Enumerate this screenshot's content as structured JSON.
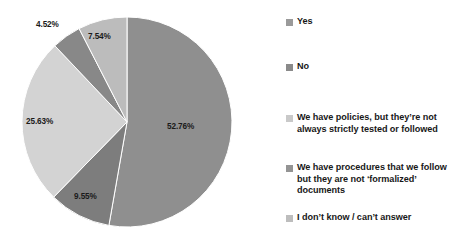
{
  "chart_data": {
    "type": "pie",
    "title": "",
    "subtitle": "",
    "xlabel": "",
    "ylabel": "",
    "grid": false,
    "legend_position": "right",
    "start_angle_deg": 0,
    "direction": "clockwise",
    "categories": [
      "Yes",
      "No",
      "We have policies, but they're not always strictly tested or followed",
      "We have procedures that we follow but they are not 'formalized' documents",
      "I don't know / can't answer"
    ],
    "values": [
      52.76,
      9.55,
      25.63,
      4.52,
      7.54
    ],
    "value_labels": [
      "52.76%",
      "9.55%",
      "25.63%",
      "4.52%",
      "7.54%"
    ],
    "colors": [
      "#8f8f8f",
      "#7d7d7d",
      "#d3d3d3",
      "#888888",
      "#bcbcbc"
    ]
  },
  "pie": {
    "center_x": 127,
    "center_y": 122,
    "radius": 105,
    "slices": [
      {
        "name": "Yes",
        "label": "52.76%",
        "value": 52.76,
        "color": "#8f8f8f",
        "label_x": 167,
        "label_y": 122
      },
      {
        "name": "No",
        "label": "9.55%",
        "value": 9.55,
        "color": "#7d7d7d",
        "label_x": 74,
        "label_y": 192
      },
      {
        "name": "Policies",
        "label": "25.63%",
        "value": 25.63,
        "color": "#d3d3d3",
        "label_x": 26,
        "label_y": 117
      },
      {
        "name": "Procedures",
        "label": "4.52%",
        "value": 4.52,
        "color": "#888888",
        "label_x": 36,
        "label_y": 20
      },
      {
        "name": "Dont know",
        "label": "7.54%",
        "value": 7.54,
        "color": "#bcbcbc",
        "label_x": 88,
        "label_y": 32
      }
    ]
  },
  "legend": {
    "items": [
      {
        "label": "Yes",
        "color": "#9a9a9a",
        "top": 0
      },
      {
        "label": "No",
        "color": "#8a8a8a",
        "top": 45
      },
      {
        "label": "We have policies, but they’re not always strictly tested or followed",
        "color": "#c9c9c9",
        "top": 96
      },
      {
        "label": "We have procedures that we follow but they are not ‘formalized’ documents",
        "color": "#949494",
        "top": 146
      },
      {
        "label": "I don’t know / can’t answer",
        "color": "#bdbdbd",
        "top": 196
      }
    ]
  }
}
